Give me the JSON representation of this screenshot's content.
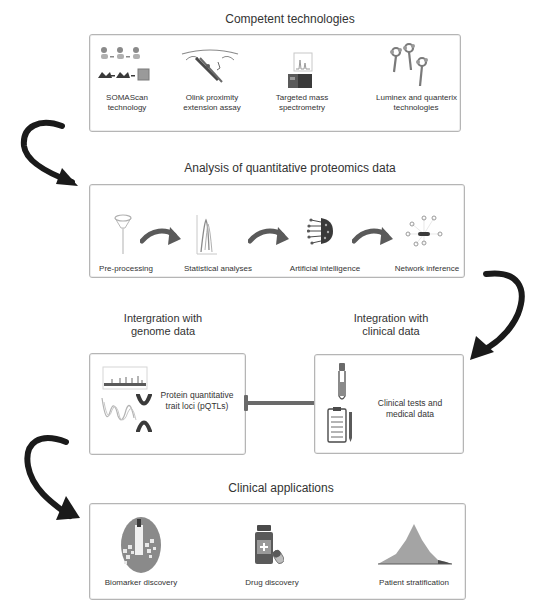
{
  "sections": {
    "technologies": {
      "title": "Competent technologies",
      "items": [
        {
          "label_line1": "SOMAScan",
          "label_line2": "technology",
          "icon": "somascan-aptamer-icon"
        },
        {
          "label_line1": "Olink proximity",
          "label_line2": "extension assay",
          "icon": "olink-antibody-dna-icon"
        },
        {
          "label_line1": "Targeted mass",
          "label_line2": "spectrometry",
          "icon": "mass-spectrometer-icon"
        },
        {
          "label_line1": "Luminex and quanterix",
          "label_line2": "technologies",
          "icon": "bead-antibody-icon"
        }
      ]
    },
    "analysis": {
      "title": "Analysis of quantitative proteomics data",
      "items": [
        {
          "label": "Pre-processing",
          "icon": "funnel-filter-icon"
        },
        {
          "label": "Statistical analyses",
          "icon": "volcano-plot-icon"
        },
        {
          "label": "Artificial intelligence",
          "icon": "neural-brain-icon"
        },
        {
          "label": "Network inference",
          "icon": "network-graph-icon"
        }
      ]
    },
    "genome": {
      "title_line1": "Intergration with",
      "title_line2": "genome data",
      "label_line1": "Protein quantitative",
      "label_line2": "trait loci (pQTLs)",
      "icons": [
        "manhattan-plot-icon",
        "dna-helix-icon",
        "chromosome-icon"
      ]
    },
    "clinical": {
      "title_line1": "Integration with",
      "title_line2": "clinical data",
      "label_line1": "Clinical tests and",
      "label_line2": "medical data",
      "icons": [
        "test-tube-icon",
        "clipboard-icon"
      ]
    },
    "applications": {
      "title": "Clinical applications",
      "items": [
        {
          "label": "Biomarker discovery",
          "icon": "biomarker-circle-icon"
        },
        {
          "label": "Drug discovery",
          "icon": "medicine-bottle-icon"
        },
        {
          "label": "Patient stratification",
          "icon": "distribution-histogram-icon"
        }
      ]
    }
  },
  "colors": {
    "arrow": "#1a1a1a",
    "box_border": "#b5b5b5",
    "icon_gray": "#7a7a7a",
    "icon_dark": "#4a4a4a",
    "connector": "#6a6a6a"
  }
}
